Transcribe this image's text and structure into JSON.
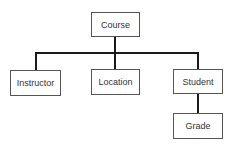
{
  "diagram": {
    "type": "hierarchy-tree",
    "root": {
      "id": "course",
      "label": "Course"
    },
    "children": [
      {
        "id": "instructor",
        "label": "Instructor"
      },
      {
        "id": "location",
        "label": "Location"
      },
      {
        "id": "student",
        "label": "Student"
      }
    ],
    "grandchildren": [
      {
        "id": "grade",
        "label": "Grade",
        "parent": "student"
      }
    ],
    "edges": [
      [
        "Course",
        "Instructor"
      ],
      [
        "Course",
        "Location"
      ],
      [
        "Course",
        "Student"
      ],
      [
        "Student",
        "Grade"
      ]
    ]
  }
}
